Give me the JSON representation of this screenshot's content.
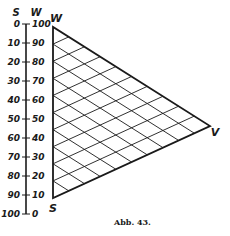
{
  "figure": {
    "caption": "Abb. 43.",
    "scale": {
      "left_header": "S",
      "right_header": "W",
      "ticks": [
        {
          "s": "0",
          "w": "100"
        },
        {
          "s": "10",
          "w": "90"
        },
        {
          "s": "20",
          "w": "80"
        },
        {
          "s": "30",
          "w": "70"
        },
        {
          "s": "40",
          "w": "60"
        },
        {
          "s": "50",
          "w": "50"
        },
        {
          "s": "60",
          "w": "40"
        },
        {
          "s": "70",
          "w": "30"
        },
        {
          "s": "80",
          "w": "20"
        },
        {
          "s": "90",
          "w": "10"
        },
        {
          "s": "100",
          "w": "0"
        }
      ]
    },
    "triangle": {
      "vertices": {
        "top": "W",
        "bottom": "S",
        "right": "V"
      },
      "grid_divisions": 10
    }
  }
}
